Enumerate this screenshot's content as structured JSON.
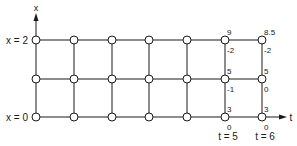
{
  "diagram": {
    "type": "finite-difference-grid",
    "axes": {
      "x_label": "x",
      "t_label": "t"
    },
    "row_labels": [
      {
        "text": "x = 2",
        "row": 0
      },
      {
        "text": "x = 0",
        "row": 2
      }
    ],
    "column_labels": [
      {
        "text": "t = 5",
        "col": 5
      },
      {
        "text": "t = 6",
        "col": 6
      }
    ],
    "grid": {
      "columns": 7,
      "rows": 3,
      "x_positions": [
        36,
        74,
        112,
        149,
        187,
        225,
        262
      ],
      "y_positions": [
        40,
        79,
        117
      ]
    },
    "node_values": [
      {
        "col": 5,
        "row": 0,
        "top": "9",
        "bottom": "-2"
      },
      {
        "col": 6,
        "row": 0,
        "top": "8.5",
        "bottom": "-2"
      },
      {
        "col": 5,
        "row": 1,
        "top": "5",
        "bottom": "-1"
      },
      {
        "col": 6,
        "row": 1,
        "top": "5",
        "bottom": "0"
      },
      {
        "col": 5,
        "row": 2,
        "top": "3",
        "bottom": "0"
      },
      {
        "col": 6,
        "row": 2,
        "top": "3",
        "bottom": "0"
      }
    ],
    "colors": {
      "line": "#1a1a1a",
      "node_fill": "#ffffff",
      "background": "#ffffff"
    }
  }
}
